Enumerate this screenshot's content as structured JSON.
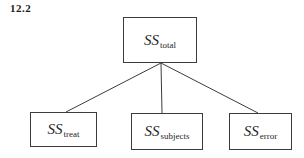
{
  "figure_label": "12.2",
  "diagram": {
    "background": "#ffffff",
    "box_border_color": "#3c3c3c",
    "line_color": "#3c3c3c",
    "root": {
      "base": "SS",
      "subscript": "total"
    },
    "children": [
      {
        "base": "SS",
        "subscript": "treat"
      },
      {
        "base": "SS",
        "subscript": "subjects"
      },
      {
        "base": "SS",
        "subscript": "error"
      }
    ]
  }
}
